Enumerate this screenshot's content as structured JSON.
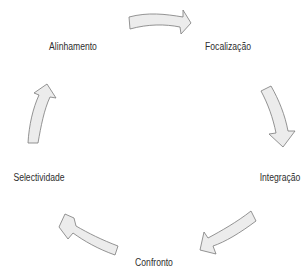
{
  "diagram": {
    "type": "cycle",
    "colors": {
      "arrow_fill": "#ececec",
      "arrow_stroke": "#7a7a7a",
      "text": "#2e2e2e",
      "background": "#ffffff"
    },
    "nodes": [
      {
        "id": "alinhamento",
        "label": "Alinhamento"
      },
      {
        "id": "focalizacao",
        "label": "Focalização"
      },
      {
        "id": "integracao",
        "label": "Integração"
      },
      {
        "id": "confronto",
        "label": "Confronto"
      },
      {
        "id": "selectividade",
        "label": "Selectividade"
      }
    ],
    "edges": [
      {
        "from": "alinhamento",
        "to": "focalizacao",
        "direction": "clockwise"
      },
      {
        "from": "focalizacao",
        "to": "integracao",
        "direction": "clockwise"
      },
      {
        "from": "integracao",
        "to": "confronto",
        "direction": "clockwise"
      },
      {
        "from": "confronto",
        "to": "selectividade",
        "direction": "clockwise"
      },
      {
        "from": "selectividade",
        "to": "alinhamento",
        "direction": "clockwise"
      }
    ]
  }
}
